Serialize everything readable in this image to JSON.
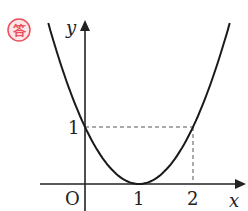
{
  "badge": {
    "text": "答",
    "color": "#e8505b"
  },
  "chart_data": {
    "type": "line",
    "title": "",
    "equation": "y = (x - 1)^2",
    "xlabel": "x",
    "ylabel": "y",
    "origin_label": "O",
    "x_ticks": [
      "1",
      "2"
    ],
    "y_ticks": [
      "1"
    ],
    "series": [
      {
        "name": "parabola",
        "x": [
          -0.7,
          -0.5,
          0,
          0.5,
          1,
          1.5,
          2,
          2.5,
          2.7
        ],
        "y": [
          2.89,
          2.25,
          1,
          0.25,
          0,
          0.25,
          1,
          2.25,
          2.89
        ]
      }
    ],
    "guides": [
      {
        "type": "dashed",
        "from": [
          0,
          1
        ],
        "to": [
          2,
          1
        ]
      },
      {
        "type": "dashed",
        "from": [
          2,
          1
        ],
        "to": [
          2,
          0
        ]
      }
    ],
    "xlim": [
      -0.7,
      2.9
    ],
    "ylim": [
      -0.4,
      2.9
    ],
    "grid": false,
    "legend": "none"
  }
}
